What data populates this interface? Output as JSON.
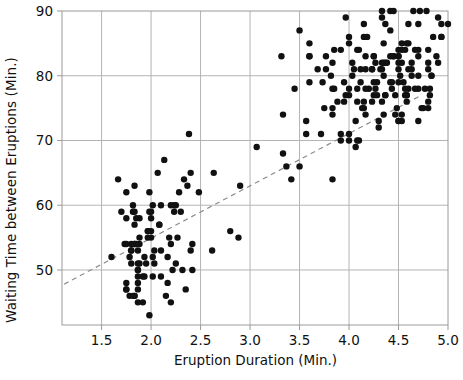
{
  "chart_data": {
    "type": "scatter",
    "title": "",
    "xlabel": "Eruption Duration (Min.)",
    "ylabel": "Waiting Time between Eruptions (Min.)",
    "xlim": [
      1.1,
      5.0
    ],
    "ylim": [
      41.5,
      90
    ],
    "xticks": [
      1.5,
      2.0,
      2.5,
      3.0,
      3.5,
      4.0,
      4.5,
      5.0
    ],
    "xticklabels": [
      "1.5",
      "2.0",
      "2.5",
      "3.0",
      "3.5",
      "4.0",
      "4.5",
      "5.0"
    ],
    "yticks": [
      50,
      60,
      70,
      80,
      90
    ],
    "yticklabels": [
      "50",
      "60",
      "70",
      "80",
      "90"
    ],
    "grid": true,
    "legend": "none",
    "marker_color": "#111111",
    "marker_size": 3.2,
    "grid_color": "#b4b4b4",
    "axis_color": "#9a9a9a",
    "trendline": {
      "style": "dashed",
      "color": "#8c8c8c",
      "x0": 1.12,
      "y0": 47.8,
      "x1": 4.72,
      "y1": 76.9
    },
    "n_points": 272,
    "points": [
      [
        3.6,
        79.0
      ],
      [
        1.8,
        54.0
      ],
      [
        3.333,
        74.0
      ],
      [
        2.283,
        62.0
      ],
      [
        4.533,
        85.0
      ],
      [
        2.883,
        55.0
      ],
      [
        4.7,
        88.0
      ],
      [
        3.6,
        85.0
      ],
      [
        1.95,
        51.0
      ],
      [
        4.35,
        85.0
      ],
      [
        1.833,
        54.0
      ],
      [
        3.917,
        84.0
      ],
      [
        4.2,
        78.0
      ],
      [
        1.75,
        47.0
      ],
      [
        4.7,
        83.0
      ],
      [
        2.167,
        52.0
      ],
      [
        1.75,
        62.0
      ],
      [
        4.8,
        84.0
      ],
      [
        1.6,
        52.0
      ],
      [
        4.25,
        79.0
      ],
      [
        1.8,
        51.0
      ],
      [
        1.75,
        47.0
      ],
      [
        3.45,
        78.0
      ],
      [
        3.067,
        69.0
      ],
      [
        4.533,
        74.0
      ],
      [
        3.6,
        83.0
      ],
      [
        1.967,
        55.0
      ],
      [
        4.083,
        76.0
      ],
      [
        3.85,
        78.0
      ],
      [
        4.433,
        79.0
      ],
      [
        4.3,
        73.0
      ],
      [
        4.467,
        77.0
      ],
      [
        3.367,
        66.0
      ],
      [
        4.033,
        80.0
      ],
      [
        3.833,
        74.0
      ],
      [
        2.017,
        52.0
      ],
      [
        1.867,
        48.0
      ],
      [
        4.833,
        80.0
      ],
      [
        1.833,
        59.0
      ],
      [
        4.783,
        90.0
      ],
      [
        4.35,
        80.0
      ],
      [
        1.883,
        58.0
      ],
      [
        4.567,
        84.0
      ],
      [
        1.75,
        58.0
      ],
      [
        4.533,
        73.0
      ],
      [
        3.317,
        83.0
      ],
      [
        3.833,
        64.0
      ],
      [
        2.1,
        53.0
      ],
      [
        4.633,
        82.0
      ],
      [
        2.0,
        59.0
      ],
      [
        4.8,
        75.0
      ],
      [
        4.716,
        90.0
      ],
      [
        1.833,
        54.0
      ],
      [
        4.833,
        80.0
      ],
      [
        1.733,
        54.0
      ],
      [
        4.883,
        83.0
      ],
      [
        3.717,
        71.0
      ],
      [
        1.667,
        64.0
      ],
      [
        4.567,
        77.0
      ],
      [
        4.317,
        81.0
      ],
      [
        2.233,
        59.0
      ],
      [
        4.5,
        84.0
      ],
      [
        1.75,
        48.0
      ],
      [
        4.8,
        82.0
      ],
      [
        1.817,
        60.0
      ],
      [
        4.4,
        92.0
      ],
      [
        4.167,
        78.0
      ],
      [
        4.7,
        78.0
      ],
      [
        2.067,
        65.0
      ],
      [
        4.7,
        73.0
      ],
      [
        4.033,
        82.0
      ],
      [
        1.967,
        56.0
      ],
      [
        4.5,
        79.0
      ],
      [
        4.0,
        71.0
      ],
      [
        1.983,
        62.0
      ],
      [
        5.067,
        76.0
      ],
      [
        2.017,
        60.0
      ],
      [
        4.567,
        78.0
      ],
      [
        3.883,
        76.0
      ],
      [
        3.6,
        83.0
      ],
      [
        4.133,
        75.0
      ],
      [
        4.333,
        82.0
      ],
      [
        4.1,
        70.0
      ],
      [
        2.633,
        65.0
      ],
      [
        4.067,
        73.0
      ],
      [
        4.933,
        88.0
      ],
      [
        3.95,
        76.0
      ],
      [
        4.517,
        80.0
      ],
      [
        2.167,
        48.0
      ],
      [
        4.0,
        86.0
      ],
      [
        2.2,
        60.0
      ],
      [
        4.333,
        90.0
      ],
      [
        1.867,
        50.0
      ],
      [
        4.817,
        78.0
      ],
      [
        1.833,
        63.0
      ],
      [
        4.3,
        72.0
      ],
      [
        4.667,
        84.0
      ],
      [
        3.75,
        75.0
      ],
      [
        1.867,
        51.0
      ],
      [
        4.9,
        82.0
      ],
      [
        2.483,
        62.0
      ],
      [
        4.367,
        88.0
      ],
      [
        2.1,
        49.0
      ],
      [
        4.5,
        83.0
      ],
      [
        4.05,
        81.0
      ],
      [
        1.867,
        47.0
      ],
      [
        4.7,
        84.0
      ],
      [
        1.783,
        52.0
      ],
      [
        4.85,
        86.0
      ],
      [
        3.683,
        81.0
      ],
      [
        4.733,
        75.0
      ],
      [
        2.3,
        59.0
      ],
      [
        4.9,
        89.0
      ],
      [
        4.417,
        79.0
      ],
      [
        1.7,
        59.0
      ],
      [
        4.633,
        81.0
      ],
      [
        2.317,
        50.0
      ],
      [
        4.6,
        85.0
      ],
      [
        1.817,
        59.0
      ],
      [
        4.417,
        87.0
      ],
      [
        2.617,
        53.0
      ],
      [
        4.067,
        69.0
      ],
      [
        4.25,
        77.0
      ],
      [
        1.967,
        56.0
      ],
      [
        4.6,
        88.0
      ],
      [
        3.767,
        81.0
      ],
      [
        1.917,
        45.0
      ],
      [
        4.5,
        82.0
      ],
      [
        2.267,
        55.0
      ],
      [
        4.65,
        90.0
      ],
      [
        1.867,
        45.0
      ],
      [
        4.167,
        83.0
      ],
      [
        2.8,
        56.0
      ],
      [
        4.333,
        89.0
      ],
      [
        1.833,
        46.0
      ],
      [
        4.383,
        82.0
      ],
      [
        1.883,
        51.0
      ],
      [
        4.933,
        86.0
      ],
      [
        2.033,
        53.0
      ],
      [
        3.733,
        79.0
      ],
      [
        4.233,
        81.0
      ],
      [
        2.233,
        60.0
      ],
      [
        4.533,
        82.0
      ],
      [
        4.817,
        77.0
      ],
      [
        4.333,
        76.0
      ],
      [
        1.983,
        59.0
      ],
      [
        4.633,
        80.0
      ],
      [
        2.017,
        49.0
      ],
      [
        5.1,
        96.0
      ],
      [
        1.8,
        53.0
      ],
      [
        5.033,
        77.0
      ],
      [
        4.0,
        77.0
      ],
      [
        2.4,
        65.0
      ],
      [
        4.6,
        81.0
      ],
      [
        3.567,
        71.0
      ],
      [
        4.0,
        70.0
      ],
      [
        4.5,
        81.0
      ],
      [
        4.083,
        93.0
      ],
      [
        1.8,
        53.0
      ],
      [
        3.967,
        89.0
      ],
      [
        2.2,
        45.0
      ],
      [
        4.15,
        86.0
      ],
      [
        2.0,
        58.0
      ],
      [
        3.833,
        78.0
      ],
      [
        3.5,
        66.0
      ],
      [
        4.583,
        76.0
      ],
      [
        2.367,
        63.0
      ],
      [
        5.0,
        88.0
      ],
      [
        1.933,
        52.0
      ],
      [
        4.617,
        93.0
      ],
      [
        1.917,
        49.0
      ],
      [
        2.083,
        57.0
      ],
      [
        4.583,
        77.0
      ],
      [
        3.333,
        68.0
      ],
      [
        4.167,
        81.0
      ],
      [
        4.333,
        81.0
      ],
      [
        4.5,
        73.0
      ],
      [
        2.417,
        50.0
      ],
      [
        4.0,
        85.0
      ],
      [
        4.167,
        74.0
      ],
      [
        1.883,
        55.0
      ],
      [
        4.583,
        77.0
      ],
      [
        4.25,
        83.0
      ],
      [
        3.767,
        83.0
      ],
      [
        2.033,
        51.0
      ],
      [
        4.433,
        78.0
      ],
      [
        4.083,
        84.0
      ],
      [
        1.833,
        46.0
      ],
      [
        4.417,
        83.0
      ],
      [
        2.183,
        55.0
      ],
      [
        4.8,
        81.0
      ],
      [
        1.833,
        57.0
      ],
      [
        4.8,
        76.0
      ],
      [
        4.1,
        84.0
      ],
      [
        3.966,
        77.0
      ],
      [
        4.233,
        81.0
      ],
      [
        3.5,
        87.0
      ],
      [
        4.366,
        77.0
      ],
      [
        2.25,
        51.0
      ],
      [
        4.667,
        78.0
      ],
      [
        2.1,
        60.0
      ],
      [
        4.35,
        82.0
      ],
      [
        4.133,
        91.0
      ],
      [
        1.867,
        53.0
      ],
      [
        4.6,
        78.0
      ],
      [
        1.783,
        46.0
      ],
      [
        4.367,
        77.0
      ],
      [
        3.85,
        84.0
      ],
      [
        1.933,
        49.0
      ],
      [
        4.5,
        83.0
      ],
      [
        2.383,
        71.0
      ],
      [
        4.7,
        80.0
      ],
      [
        1.867,
        49.0
      ],
      [
        3.833,
        75.0
      ],
      [
        3.417,
        64.0
      ],
      [
        4.233,
        76.0
      ],
      [
        2.4,
        53.0
      ],
      [
        4.8,
        94.0
      ],
      [
        2.0,
        55.0
      ],
      [
        4.15,
        76.0
      ],
      [
        1.867,
        50.0
      ],
      [
        4.267,
        82.0
      ],
      [
        1.75,
        54.0
      ],
      [
        4.483,
        75.0
      ],
      [
        4.0,
        78.0
      ],
      [
        4.117,
        79.0
      ],
      [
        4.083,
        78.0
      ],
      [
        4.267,
        78.0
      ],
      [
        3.917,
        70.0
      ],
      [
        4.55,
        79.0
      ],
      [
        4.083,
        70.0
      ],
      [
        2.417,
        54.0
      ],
      [
        4.183,
        86.0
      ],
      [
        2.217,
        50.0
      ],
      [
        4.45,
        90.0
      ],
      [
        1.883,
        54.0
      ],
      [
        1.85,
        54.0
      ],
      [
        4.283,
        77.0
      ],
      [
        3.95,
        79.0
      ],
      [
        2.333,
        64.0
      ],
      [
        4.15,
        75.0
      ],
      [
        2.35,
        47.0
      ],
      [
        4.933,
        86.0
      ],
      [
        2.9,
        63.0
      ],
      [
        4.583,
        85.0
      ],
      [
        3.833,
        82.0
      ],
      [
        2.083,
        57.0
      ],
      [
        4.367,
        82.0
      ],
      [
        2.133,
        67.0
      ],
      [
        4.35,
        74.0
      ],
      [
        2.2,
        54.0
      ],
      [
        4.45,
        83.0
      ],
      [
        3.567,
        73.0
      ],
      [
        4.5,
        73.0
      ],
      [
        4.15,
        88.0
      ],
      [
        3.817,
        80.0
      ],
      [
        3.917,
        71.0
      ],
      [
        4.45,
        83.0
      ],
      [
        2.0,
        56.0
      ],
      [
        4.283,
        79.0
      ],
      [
        4.767,
        78.0
      ],
      [
        4.533,
        84.0
      ],
      [
        1.85,
        58.0
      ],
      [
        4.25,
        83.0
      ],
      [
        1.983,
        43.0
      ],
      [
        2.25,
        60.0
      ],
      [
        4.75,
        75.0
      ],
      [
        4.117,
        81.0
      ],
      [
        2.15,
        46.0
      ],
      [
        4.417,
        90.0
      ],
      [
        1.817,
        46.0
      ],
      [
        4.467,
        74.0
      ]
    ]
  }
}
